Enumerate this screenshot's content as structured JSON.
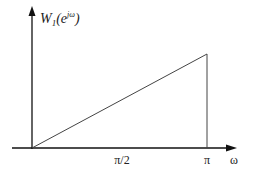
{
  "figure": {
    "type": "frequency-response-plot",
    "y_label": {
      "main": "W",
      "subscript": "1",
      "arg_open": "(e",
      "superscript": "jω",
      "arg_close": ")"
    },
    "x_label": "ω",
    "x_ticks": [
      {
        "label": "π/2",
        "value": 1.5708
      },
      {
        "label": "π",
        "value": 3.1416
      }
    ],
    "curve": {
      "description": "linear ramp from 0 at ω=0 up to max at ω=π, then vertical drop to 0",
      "points": [
        [
          0,
          0
        ],
        [
          3.1416,
          1
        ],
        [
          3.1416,
          0
        ]
      ]
    },
    "colors": {
      "line": "#333333",
      "axis": "#111111",
      "background": "#ffffff"
    }
  }
}
